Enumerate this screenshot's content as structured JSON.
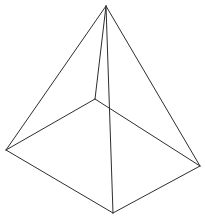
{
  "figure": {
    "name": "square-pyramid-wireframe",
    "type": "line-drawing",
    "title": "",
    "background_color": "#ffffff",
    "stroke_color": "#2e2e2e",
    "stroke_width": 1,
    "canvas": {
      "width": 205,
      "height": 219
    },
    "vertices": {
      "apex": {
        "label": "apex",
        "x": 106,
        "y": 6
      },
      "front": {
        "label": "front-corner",
        "x": 113,
        "y": 213
      },
      "left": {
        "label": "left-corner",
        "x": 6,
        "y": 150
      },
      "right": {
        "label": "right-corner",
        "x": 200,
        "y": 166
      },
      "back": {
        "label": "back-corner",
        "x": 95,
        "y": 99
      }
    },
    "edges": [
      {
        "name": "apex-to-left",
        "from": "apex",
        "to": "left",
        "d": "M106,6 L6,150"
      },
      {
        "name": "apex-to-right",
        "from": "apex",
        "to": "right",
        "d": "M106,6 L200,166"
      },
      {
        "name": "apex-to-front",
        "from": "apex",
        "to": "front",
        "d": "M106,6 L113,213"
      },
      {
        "name": "apex-to-back",
        "from": "apex",
        "to": "back",
        "d": "M106,6 L95,99"
      },
      {
        "name": "base-left-front",
        "from": "left",
        "to": "front",
        "d": "M6,150 L113,213"
      },
      {
        "name": "base-front-right",
        "from": "front",
        "to": "right",
        "d": "M113,213 L200,166"
      },
      {
        "name": "base-back-left",
        "from": "back",
        "to": "left",
        "d": "M95,99 L6,150"
      },
      {
        "name": "base-back-right",
        "from": "back",
        "to": "right",
        "d": "M95,99 L200,166"
      }
    ]
  }
}
